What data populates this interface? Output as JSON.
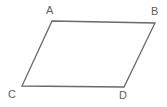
{
  "figure": {
    "name": "parallelogram",
    "background_color": "#ffffff",
    "stroke_color": "#6a6a6a",
    "stroke_width": 1.3,
    "label_color": "#5d5d5d",
    "vertices": [
      {
        "id": "A",
        "label": "A",
        "x": 52,
        "y": 21,
        "label_position": "above"
      },
      {
        "id": "B",
        "label": "B",
        "x": 155,
        "y": 23,
        "label_position": "above-right"
      },
      {
        "id": "C",
        "label": "C",
        "x": 22,
        "y": 86,
        "label_position": "below-left"
      },
      {
        "id": "D",
        "label": "D",
        "x": 124,
        "y": 87,
        "label_position": "below"
      }
    ],
    "edges": [
      {
        "from": "A",
        "to": "B",
        "name": "top-edge"
      },
      {
        "from": "B",
        "to": "D",
        "name": "right-edge"
      },
      {
        "from": "D",
        "to": "C",
        "name": "bottom-edge"
      },
      {
        "from": "C",
        "to": "A",
        "name": "left-edge"
      }
    ],
    "path": "M 52 21 L 155 23 L 124 87 L 22 86 Z"
  }
}
